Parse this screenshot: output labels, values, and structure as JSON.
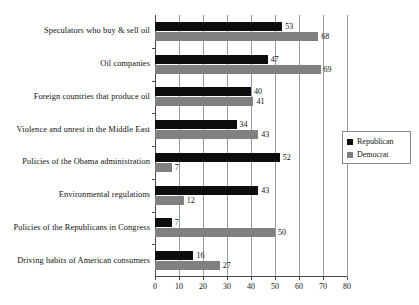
{
  "chart_data": {
    "type": "bar",
    "orientation": "horizontal",
    "title": "",
    "subtitle": "",
    "xlabel": "",
    "ylabel": "",
    "xlim": [
      0,
      80
    ],
    "xticks": [
      0,
      10,
      20,
      30,
      40,
      50,
      60,
      70,
      80
    ],
    "xtick_labels": [
      "0",
      "10",
      "20",
      "30",
      "40",
      "50",
      "60",
      "70",
      "80"
    ],
    "grid": true,
    "grid_axis": "x",
    "legend_position": "right",
    "categories": [
      "Speculators who buy & sell oil",
      "Oil companies",
      "Foreign countries that produce oil",
      "Violence and unrest in the Middle East",
      "Policies of the Obama administration",
      "Environmental regulations",
      "Policies of the Republicans in Congress",
      "Driving habits of American consumers"
    ],
    "series": [
      {
        "name": "Republican",
        "color": "#0d0d0d",
        "values": [
          53,
          47,
          40,
          34,
          52,
          43,
          7,
          16
        ]
      },
      {
        "name": "Democrat",
        "color": "#808080",
        "values": [
          68,
          69,
          41,
          43,
          7,
          12,
          50,
          27
        ]
      }
    ]
  },
  "legend": {
    "items": [
      {
        "label": "Republican",
        "swatch": "republican-swatch"
      },
      {
        "label": "Democrat",
        "swatch": "democrat-swatch"
      }
    ]
  }
}
